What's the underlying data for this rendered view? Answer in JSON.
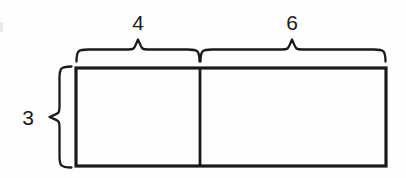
{
  "figure": {
    "kind": "geometry-diagram",
    "background_color": "#fefefe",
    "stroke_color": "#1a1a1a",
    "labels": {
      "top_left_segment": "4",
      "top_right_segment": "6",
      "left_side": "3"
    },
    "shape": {
      "rect": {
        "x": 76,
        "y": 68,
        "width": 310,
        "height": 98
      },
      "divider_x": 200
    },
    "braces": {
      "top_left": {
        "start_x": 76,
        "end_x": 200,
        "tip_x": 138,
        "arm_y": 60,
        "tip_y": 38
      },
      "top_right": {
        "start_x": 200,
        "end_x": 386,
        "tip_x": 292,
        "arm_y": 60,
        "tip_y": 38
      },
      "left": {
        "start_y": 66,
        "end_y": 168,
        "tip_y": 117,
        "arm_x": 72,
        "tip_x": 50
      }
    },
    "label_positions": {
      "top_left_segment": {
        "x": 138,
        "y": 22
      },
      "top_right_segment": {
        "x": 292,
        "y": 22
      },
      "left_side": {
        "x": 28,
        "y": 117
      }
    }
  }
}
